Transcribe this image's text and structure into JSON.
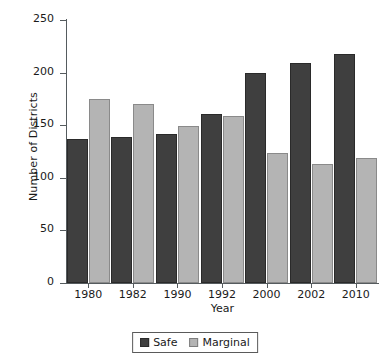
{
  "chart_data": {
    "type": "bar",
    "title": "",
    "xlabel": "Year",
    "ylabel": "Number of Districts",
    "categories": [
      "1980",
      "1982",
      "1990",
      "1992",
      "2000",
      "2002",
      "2010"
    ],
    "series": [
      {
        "name": "Safe",
        "color": "#3f3f3f",
        "values": [
          137,
          139,
          142,
          161,
          200,
          209,
          218
        ]
      },
      {
        "name": "Marginal",
        "color": "#b4b4b4",
        "values": [
          175,
          170,
          149,
          159,
          124,
          113,
          119
        ]
      }
    ],
    "ylim": [
      0,
      250
    ],
    "yticks": [
      0,
      50,
      100,
      150,
      200,
      250
    ],
    "grid": false,
    "legend_position": "bottom-center"
  }
}
